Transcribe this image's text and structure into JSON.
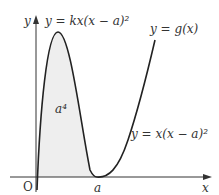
{
  "diagram": {
    "axes": {
      "x_label": "x",
      "y_label": "y",
      "origin_label": "O"
    },
    "curves": [
      {
        "name": "upper-curve",
        "label": "y = kx(x − a)²"
      },
      {
        "name": "lower-curve",
        "label": "y = x(x − a)²"
      },
      {
        "name": "g-curve",
        "label": "y = g(x)"
      }
    ],
    "shaded_region_label": "a⁴",
    "x_marker_label": "a",
    "colors": {
      "curve": "#222222",
      "axis": "#333333",
      "shade": "#eeeeee"
    }
  }
}
